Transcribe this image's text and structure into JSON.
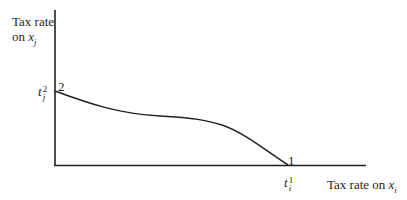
{
  "diagram": {
    "y_axis_label": {
      "line1": "Tax rate",
      "line2_prefix": "on ",
      "var": "x",
      "sub": "j"
    },
    "x_axis_label": {
      "prefix": "Tax rate on ",
      "var": "x",
      "sub": "i"
    },
    "y_intercept": {
      "var": "t",
      "sub": "j",
      "sup": "2",
      "point_label": "2"
    },
    "x_intercept": {
      "var": "t",
      "sub": "i",
      "sup": "1",
      "point_label": "1"
    },
    "colors": {
      "line": "#231f20",
      "background": "#ffffff"
    }
  }
}
